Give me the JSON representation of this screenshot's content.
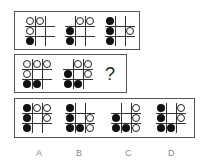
{
  "puzzle": {
    "legend": {
      "b": "black-dot",
      "w": "white-circle",
      "_": "empty"
    },
    "row1": {
      "grids": [
        [
          "ww_",
          "w__",
          "b__"
        ],
        [
          "_ww",
          "b__",
          "b__"
        ],
        [
          "b__",
          "b_w",
          "b__"
        ]
      ]
    },
    "row2": {
      "grids": [
        [
          "www",
          "w__",
          "bb_"
        ],
        [
          "_ww",
          "b_w",
          "bb_"
        ]
      ],
      "question_mark": "?"
    },
    "options": [
      {
        "label": "A",
        "grid": [
          "bww",
          "b_w",
          "b__"
        ]
      },
      {
        "label": "B",
        "grid": [
          "b__",
          "b_w",
          "bbw"
        ]
      },
      {
        "label": "C",
        "grid": [
          "__w",
          "b_w",
          "bbw"
        ]
      },
      {
        "label": "D",
        "grid": [
          "b_w",
          "b_w",
          "bb_"
        ]
      }
    ]
  }
}
